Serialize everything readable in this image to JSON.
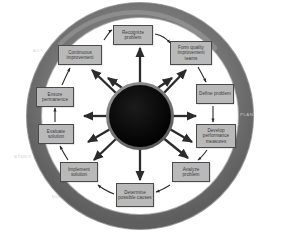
{
  "diagram": {
    "type": "cycle-diagram",
    "center": {
      "name": "hub",
      "fill": "#0a0a0a",
      "rim": "#7a7a7a",
      "label": ""
    },
    "ring": {
      "fill_outer": "#6e6e6e",
      "fill_inner": "#8f8f8f",
      "highlight": "#9d9d9d"
    },
    "box_style": {
      "fill": "#b9b9b9",
      "border": "#4a4a4a",
      "text": "#3a3a3a"
    },
    "arrow_color": "#2b2b2b",
    "quadrant_labels": [
      {
        "label": "ACT",
        "position": "upper-left",
        "x": 33,
        "y": 48,
        "faint": true
      },
      {
        "label": "PLAN",
        "position": "right",
        "x": 240,
        "y": 112,
        "faint": false
      },
      {
        "label": "STUDY",
        "position": "lower-left",
        "x": 14,
        "y": 154,
        "faint": false
      },
      {
        "label": "DO",
        "position": "bottom-left",
        "x": 52,
        "y": 194,
        "faint": false
      }
    ],
    "steps": [
      {
        "index": 1,
        "label": "Recognize problem",
        "x": 113,
        "y": 25,
        "w": 40,
        "h": 20
      },
      {
        "index": 2,
        "label": "Form quality improvement teams",
        "x": 170,
        "y": 41,
        "w": 42,
        "h": 24
      },
      {
        "index": 3,
        "label": "Define problem",
        "x": 196,
        "y": 84,
        "w": 38,
        "h": 20
      },
      {
        "index": 4,
        "label": "Develop performance measures",
        "x": 196,
        "y": 124,
        "w": 40,
        "h": 24
      },
      {
        "index": 5,
        "label": "Analyze problem",
        "x": 172,
        "y": 162,
        "w": 38,
        "h": 20
      },
      {
        "index": 6,
        "label": "Determine possible causes",
        "x": 116,
        "y": 183,
        "w": 38,
        "h": 24
      },
      {
        "index": 7,
        "label": "Implement solution",
        "x": 60,
        "y": 162,
        "w": 38,
        "h": 20
      },
      {
        "index": 8,
        "label": "Evaluate solution",
        "x": 38,
        "y": 124,
        "w": 36,
        "h": 20
      },
      {
        "index": 9,
        "label": "Ensure permanence",
        "x": 36,
        "y": 87,
        "w": 38,
        "h": 20
      },
      {
        "index": 10,
        "label": "Continuous improvement",
        "x": 58,
        "y": 45,
        "w": 44,
        "h": 20
      }
    ]
  }
}
